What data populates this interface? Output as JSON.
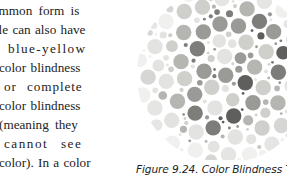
{
  "page": {
    "width": 287,
    "height": 184,
    "background": "#ffffff"
  },
  "body_text": {
    "font_style": "serif",
    "note": "Left text column is clipped at the page's left edge",
    "lines": [
      "ommon form is",
      "ple can also have",
      "blue-yellow",
      "color blindness",
      "or complete",
      "color blindness",
      "(meaning they",
      "cannot see",
      "color). In a color"
    ]
  },
  "figure": {
    "caption": "Figure 9.24. Color Blindness Test",
    "image_type": "ishihara-color-blindness-plate",
    "image_description": "Grayscale circular field of randomly sized dots forming a hidden numeral",
    "colors": {
      "background": "#ffffff",
      "dot_light": "#e3e3e1",
      "dot_mid_light": "#cfcfcc",
      "dot_mid": "#b5b5b2",
      "dot_mid_dark": "#9a9a97",
      "dot_dark": "#7d7d7a",
      "dot_darkest": "#5f5f5d"
    },
    "plate": {
      "center_x": 92,
      "center_y": 91,
      "radius": 88
    }
  }
}
